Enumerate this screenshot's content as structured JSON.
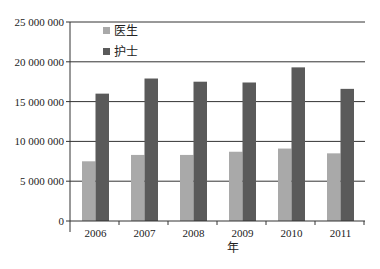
{
  "chart_data": {
    "type": "bar",
    "title": "",
    "xlabel": "年",
    "ylabel": "",
    "categories": [
      "2006",
      "2007",
      "2008",
      "2009",
      "2010",
      "2011"
    ],
    "series": [
      {
        "name": "医生",
        "color": "#a9a9a9",
        "values": [
          7500000,
          8300000,
          8300000,
          8700000,
          9100000,
          8500000
        ]
      },
      {
        "name": "护士",
        "color": "#5a5a5a",
        "values": [
          16000000,
          17900000,
          17500000,
          17400000,
          19300000,
          16600000
        ]
      }
    ],
    "ylim": [
      0,
      25000000
    ],
    "yticks": [
      0,
      5000000,
      10000000,
      15000000,
      20000000,
      25000000
    ],
    "ytick_labels": [
      "0",
      "5 000 000",
      "10 000 000",
      "15 000 000",
      "20 000 000",
      "25 000 000"
    ],
    "grid": true,
    "legend_position": "upper-left-inside"
  },
  "layout": {
    "plot_left": 70,
    "plot_right": 365,
    "plot_top": 22,
    "plot_bottom": 221,
    "gridline_color": "#333333"
  }
}
